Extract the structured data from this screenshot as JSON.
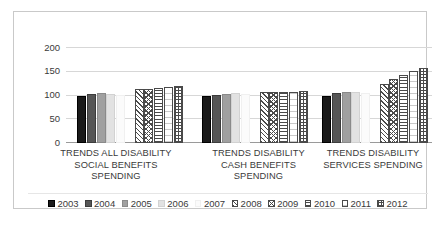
{
  "chart_data": {
    "type": "bar",
    "title": "",
    "xlabel": "",
    "ylabel": "",
    "ylim": [
      0,
      200
    ],
    "yticks": [
      0,
      50,
      100,
      150,
      200
    ],
    "grid": true,
    "legend_position": "bottom",
    "categories": [
      "TRENDS ALL DISABILITY SOCIAL BENEFITS SPENDING",
      "TRENDS DISABILITY CASH BENEFITS SPENDING",
      "TRENDS DISABILITY SERVICES SPENDING"
    ],
    "category_lines": [
      [
        "TRENDS ALL DISABILITY",
        "SOCIAL BENEFITS",
        "SPENDING"
      ],
      [
        "TRENDS DISABILITY",
        "CASH BENEFITS",
        "SPENDING"
      ],
      [
        "TRENDS DISABILITY",
        "SERVICES SPENDING"
      ]
    ],
    "series": [
      {
        "name": "2003",
        "color": "#1a1a1a",
        "pattern": "solid",
        "values": [
          100,
          100,
          100
        ]
      },
      {
        "name": "2004",
        "color": "#565656",
        "pattern": "solid",
        "values": [
          103,
          102,
          105
        ]
      },
      {
        "name": "2005",
        "color": "#a0a0a0",
        "pattern": "solid",
        "values": [
          105,
          104,
          107
        ]
      },
      {
        "name": "2006",
        "color": "#e2e2e2",
        "pattern": "solid",
        "values": [
          103,
          105,
          108
        ]
      },
      {
        "name": "2007",
        "color": "#fbfbfb",
        "pattern": "solid",
        "values": [
          101,
          103,
          106
        ]
      },
      {
        "name": "2008",
        "color": "#ffffff",
        "pattern": "diagonal-up",
        "values": [
          113,
          108,
          125
        ]
      },
      {
        "name": "2009",
        "color": "#ffffff",
        "pattern": "chevron",
        "values": [
          113,
          107,
          134
        ]
      },
      {
        "name": "2010",
        "color": "#ffffff",
        "pattern": "horizontal",
        "values": [
          116,
          108,
          143
        ]
      },
      {
        "name": "2011",
        "color": "#ffffff",
        "pattern": "wide-horizontal",
        "values": [
          118,
          108,
          151
        ]
      },
      {
        "name": "2012",
        "color": "#ffffff",
        "pattern": "grid",
        "values": [
          120,
          110,
          158
        ]
      }
    ]
  }
}
